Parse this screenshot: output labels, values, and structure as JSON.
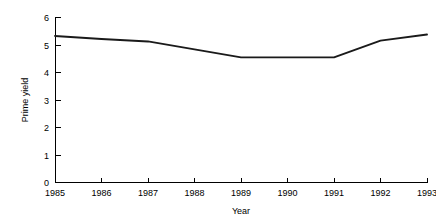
{
  "chart_data": {
    "type": "line",
    "title": "",
    "subtitle": "",
    "xlabel": "Year",
    "ylabel": "Prime yield",
    "categories": [
      1985,
      1986,
      1987,
      1988,
      1989,
      1990,
      1991,
      1992,
      1993
    ],
    "x": [
      1985,
      1986,
      1987,
      1988,
      1989,
      1990,
      1991,
      1992,
      1993
    ],
    "values": [
      5.33,
      5.22,
      5.13,
      4.84,
      4.55,
      4.55,
      4.55,
      5.16,
      5.38
    ],
    "series": [
      {
        "name": "Prime yield",
        "values": [
          5.33,
          5.22,
          5.13,
          4.84,
          4.55,
          4.55,
          4.55,
          5.16,
          5.38
        ],
        "color": "#1a1a1a"
      }
    ],
    "xlim": [
      1985,
      1993
    ],
    "ylim": [
      0,
      6
    ],
    "xticks": [
      1985,
      1986,
      1987,
      1988,
      1989,
      1990,
      1991,
      1992,
      1993
    ],
    "yticks": [
      0,
      1,
      2,
      3,
      4,
      5,
      6
    ],
    "xtick_labels": [
      "1985",
      "1986",
      "1987",
      "1988",
      "1989",
      "1990",
      "1991",
      "1992",
      "1993"
    ],
    "ytick_labels": [
      "0",
      "1",
      "2",
      "3",
      "4",
      "5",
      "6"
    ],
    "grid": false,
    "legend": false,
    "legend_position": "none",
    "background_color": "#ffffff",
    "axis_color": "#000000"
  },
  "axes": {
    "y_title": "Prime yield",
    "x_title": "Year",
    "y_ticks": [
      {
        "label": "6",
        "value": 6
      },
      {
        "label": "5",
        "value": 5
      },
      {
        "label": "4",
        "value": 4
      },
      {
        "label": "3",
        "value": 3
      },
      {
        "label": "2",
        "value": 2
      },
      {
        "label": "1",
        "value": 1
      },
      {
        "label": "0",
        "value": 0
      }
    ],
    "x_ticks": [
      {
        "label": "1985",
        "value": 1985
      },
      {
        "label": "1986",
        "value": 1986
      },
      {
        "label": "1987",
        "value": 1987
      },
      {
        "label": "1988",
        "value": 1988
      },
      {
        "label": "1989",
        "value": 1989
      },
      {
        "label": "1990",
        "value": 1990
      },
      {
        "label": "1991",
        "value": 1991
      },
      {
        "label": "1992",
        "value": 1992
      },
      {
        "label": "1993",
        "value": 1993
      }
    ]
  }
}
